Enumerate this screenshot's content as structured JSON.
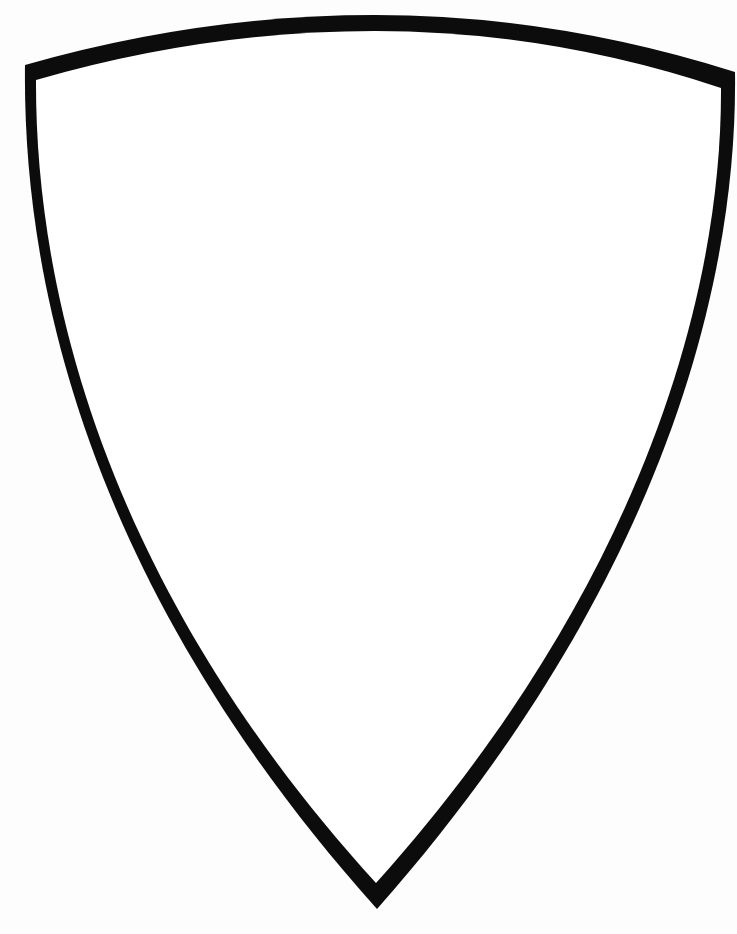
{
  "image": {
    "subject": "shield outline",
    "background_color": "#fdfdfd",
    "shield_fill": "#ffffff",
    "outline_color": "#0c0c0c"
  }
}
